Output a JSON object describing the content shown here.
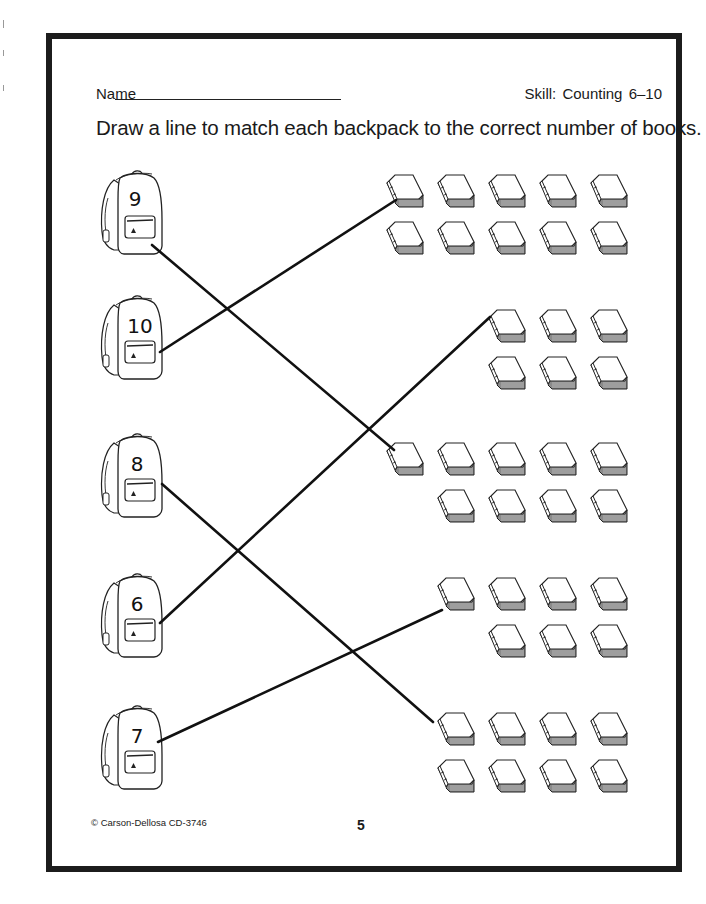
{
  "header": {
    "name_label": "Name",
    "skill_label": "Skill:  Counting  6–10"
  },
  "instructions": "Draw a line to match each backpack to the correct number of books.",
  "backpacks": [
    {
      "number": "9",
      "x": 100,
      "y": 170
    },
    {
      "number": "10",
      "x": 100,
      "y": 295
    },
    {
      "number": "8",
      "x": 100,
      "y": 433
    },
    {
      "number": "6",
      "x": 100,
      "y": 573
    },
    {
      "number": "7",
      "x": 100,
      "y": 705
    }
  ],
  "book_groups": [
    {
      "count": 10,
      "rows": [
        [
          385,
          436,
          487,
          538,
          589
        ],
        [
          385,
          436,
          487,
          538,
          589
        ]
      ],
      "row_y": [
        175,
        222
      ]
    },
    {
      "count": 6,
      "rows": [
        [
          487,
          538,
          589
        ],
        [
          487,
          538,
          589
        ]
      ],
      "row_y": [
        310,
        357
      ]
    },
    {
      "count": 9,
      "rows": [
        [
          385,
          436,
          487,
          538,
          589
        ],
        [
          436,
          487,
          538,
          589
        ]
      ],
      "row_y": [
        443,
        490
      ]
    },
    {
      "count": 7,
      "rows": [
        [
          436,
          487,
          538,
          589
        ],
        [
          487,
          538,
          589
        ]
      ],
      "row_y": [
        578,
        625
      ]
    },
    {
      "count": 8,
      "rows": [
        [
          436,
          487,
          538,
          589
        ],
        [
          436,
          487,
          538,
          589
        ]
      ],
      "row_y": [
        713,
        760
      ]
    }
  ],
  "match_lines": [
    {
      "from": "9",
      "to_count": 9,
      "x1": 152,
      "y1": 245,
      "x2": 394,
      "y2": 450
    },
    {
      "from": "10",
      "to_count": 10,
      "x1": 160,
      "y1": 352,
      "x2": 396,
      "y2": 200
    },
    {
      "from": "8",
      "to_count": 8,
      "x1": 162,
      "y1": 484,
      "x2": 433,
      "y2": 722
    },
    {
      "from": "6",
      "to_count": 6,
      "x1": 160,
      "y1": 623,
      "x2": 490,
      "y2": 317
    },
    {
      "from": "7",
      "to_count": 7,
      "x1": 158,
      "y1": 742,
      "x2": 442,
      "y2": 610
    }
  ],
  "footer": {
    "copyright": "© Carson-Dellosa CD-3746",
    "page_number": "5"
  }
}
